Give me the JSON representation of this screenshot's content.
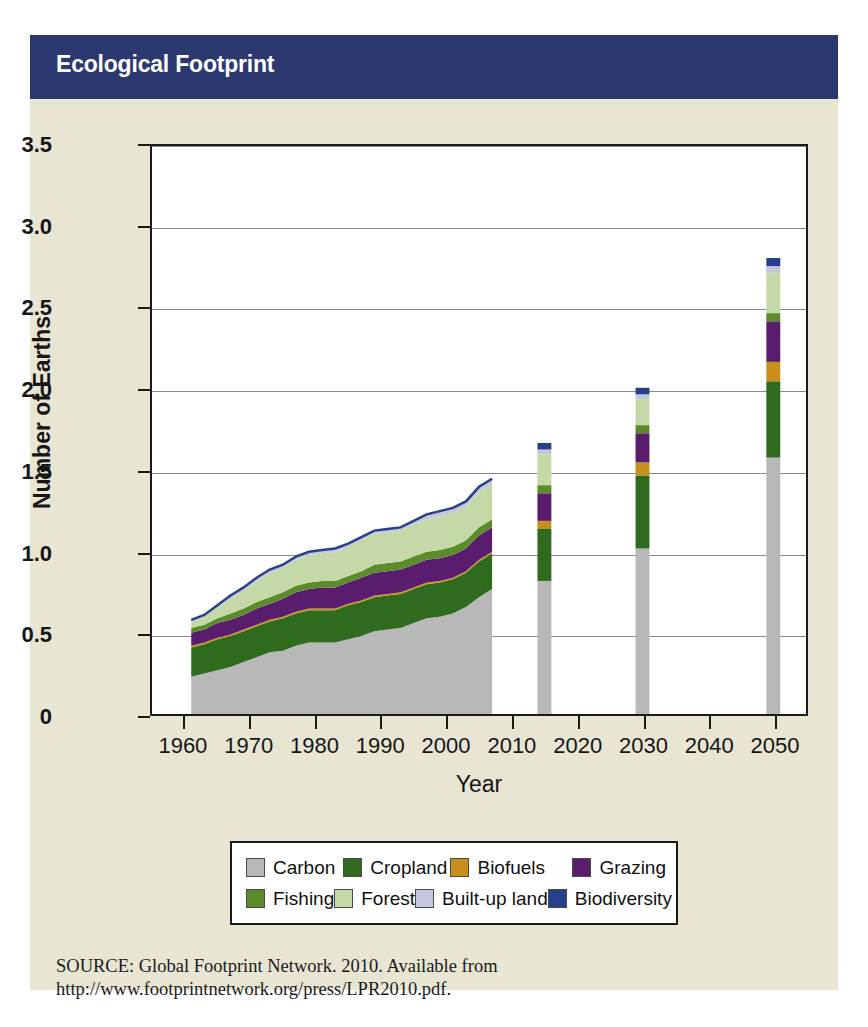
{
  "banner": {
    "title": "Ecological Footprint"
  },
  "source": {
    "line1": "SOURCE: Global Footprint Network. 2010. Available from",
    "line2": "http://www.footprintnetwork.org/press/LPR2010.pdf."
  },
  "colors": {
    "banner_bg": "#2b3970",
    "figure_bg": "#e8e5d2",
    "plot_bg": "#ffffff",
    "axis": "#1a1a1a",
    "grid": "#8a8a8a",
    "carbon": "#b8b8b8",
    "cropland": "#2e6b1f",
    "biofuels": "#c8901a",
    "grazing": "#5a1d6e",
    "fishing": "#5c8c2a",
    "forest": "#c5d9a8",
    "builtup": "#c3c6dd",
    "biodiversity": "#27408b"
  },
  "legend": {
    "rows": [
      [
        {
          "label": "Carbon",
          "key": "carbon"
        },
        {
          "label": "Cropland",
          "key": "cropland"
        },
        {
          "label": "Biofuels",
          "key": "biofuels"
        },
        {
          "label": "Grazing",
          "key": "grazing"
        }
      ],
      [
        {
          "label": "Fishing",
          "key": "fishing"
        },
        {
          "label": "Forest",
          "key": "forest"
        },
        {
          "label": "Built-up land",
          "key": "builtup"
        },
        {
          "label": "Biodiversity",
          "key": "biodiversity"
        }
      ]
    ]
  },
  "chart_data": {
    "type": "area",
    "title": "Ecological Footprint",
    "xlabel": "Year",
    "ylabel": "Number of Earths",
    "xlim": [
      1955,
      2055
    ],
    "ylim": [
      0,
      3.5
    ],
    "ytick_labels": [
      "0",
      "0.5",
      "1.0",
      "1.5",
      "2.0",
      "2.5",
      "3.0",
      "3.5"
    ],
    "ytick_values": [
      0,
      0.5,
      1.0,
      1.5,
      2.0,
      2.5,
      3.0,
      3.5
    ],
    "xtick_labels": [
      "1960",
      "1970",
      "1980",
      "1990",
      "2000",
      "2010",
      "2020",
      "2030",
      "2040",
      "2050"
    ],
    "xtick_values": [
      1960,
      1970,
      1980,
      1990,
      2000,
      2010,
      2020,
      2030,
      2040,
      2050
    ],
    "grid": "horizontal",
    "legend_position": "below-axis",
    "series_order": [
      "carbon",
      "cropland",
      "biofuels",
      "grazing",
      "fishing",
      "forest",
      "builtup",
      "biodiversity"
    ],
    "series_labels": {
      "carbon": "Carbon",
      "cropland": "Cropland",
      "biofuels": "Biofuels",
      "grazing": "Grazing",
      "fishing": "Fishing",
      "forest": "Forest",
      "builtup": "Built-up land",
      "biodiversity": "Biodiversity"
    },
    "historical": {
      "note": "Stacked area, 1961-2007",
      "x": [
        1961,
        1963,
        1965,
        1967,
        1969,
        1971,
        1973,
        1975,
        1977,
        1979,
        1981,
        1983,
        1985,
        1987,
        1989,
        1991,
        1993,
        1995,
        1997,
        1999,
        2001,
        2003,
        2005,
        2007
      ],
      "series": [
        {
          "name": "Carbon",
          "values": [
            0.23,
            0.25,
            0.27,
            0.29,
            0.32,
            0.35,
            0.38,
            0.39,
            0.42,
            0.44,
            0.44,
            0.44,
            0.46,
            0.48,
            0.51,
            0.52,
            0.53,
            0.56,
            0.59,
            0.6,
            0.62,
            0.66,
            0.72,
            0.77
          ]
        },
        {
          "name": "Cropland",
          "values": [
            0.18,
            0.18,
            0.19,
            0.19,
            0.19,
            0.19,
            0.19,
            0.2,
            0.2,
            0.2,
            0.2,
            0.2,
            0.21,
            0.21,
            0.21,
            0.21,
            0.21,
            0.21,
            0.21,
            0.21,
            0.21,
            0.21,
            0.22,
            0.22
          ]
        },
        {
          "name": "Biofuels",
          "values": [
            0.01,
            0.01,
            0.01,
            0.01,
            0.01,
            0.01,
            0.01,
            0.01,
            0.01,
            0.01,
            0.01,
            0.01,
            0.01,
            0.01,
            0.01,
            0.01,
            0.01,
            0.01,
            0.01,
            0.01,
            0.01,
            0.01,
            0.01,
            0.01
          ]
        },
        {
          "name": "Grazing",
          "values": [
            0.08,
            0.08,
            0.09,
            0.09,
            0.09,
            0.1,
            0.1,
            0.11,
            0.12,
            0.12,
            0.13,
            0.13,
            0.13,
            0.14,
            0.14,
            0.14,
            0.14,
            0.14,
            0.14,
            0.14,
            0.14,
            0.14,
            0.15,
            0.15
          ]
        },
        {
          "name": "Fishing",
          "values": [
            0.03,
            0.03,
            0.03,
            0.04,
            0.04,
            0.04,
            0.04,
            0.04,
            0.04,
            0.04,
            0.04,
            0.04,
            0.04,
            0.04,
            0.05,
            0.05,
            0.05,
            0.05,
            0.05,
            0.05,
            0.05,
            0.05,
            0.05,
            0.05
          ]
        },
        {
          "name": "Forest",
          "values": [
            0.04,
            0.05,
            0.07,
            0.09,
            0.11,
            0.13,
            0.15,
            0.15,
            0.16,
            0.17,
            0.17,
            0.18,
            0.18,
            0.19,
            0.19,
            0.19,
            0.19,
            0.2,
            0.2,
            0.21,
            0.21,
            0.21,
            0.22,
            0.22
          ]
        },
        {
          "name": "Built-up land",
          "values": [
            0.01,
            0.01,
            0.01,
            0.02,
            0.02,
            0.02,
            0.02,
            0.02,
            0.02,
            0.02,
            0.02,
            0.02,
            0.02,
            0.02,
            0.02,
            0.02,
            0.02,
            0.02,
            0.03,
            0.03,
            0.03,
            0.03,
            0.03,
            0.03
          ]
        }
      ],
      "totals": [
        0.58,
        0.61,
        0.67,
        0.73,
        0.78,
        0.84,
        0.89,
        0.92,
        0.97,
        1.0,
        1.01,
        1.02,
        1.05,
        1.09,
        1.13,
        1.14,
        1.15,
        1.19,
        1.23,
        1.25,
        1.27,
        1.31,
        1.4,
        1.45
      ]
    },
    "projections": [
      {
        "year": 2015,
        "total": 1.67,
        "segments": [
          {
            "name": "Carbon",
            "value": 0.82
          },
          {
            "name": "Cropland",
            "value": 0.32
          },
          {
            "name": "Biofuels",
            "value": 0.05
          },
          {
            "name": "Grazing",
            "value": 0.17
          },
          {
            "name": "Fishing",
            "value": 0.05
          },
          {
            "name": "Forest",
            "value": 0.19
          },
          {
            "name": "Built-up land",
            "value": 0.03
          },
          {
            "name": "Biodiversity",
            "value": 0.04
          }
        ]
      },
      {
        "year": 2030,
        "total": 2.01,
        "segments": [
          {
            "name": "Carbon",
            "value": 1.02
          },
          {
            "name": "Cropland",
            "value": 0.45
          },
          {
            "name": "Biofuels",
            "value": 0.08
          },
          {
            "name": "Grazing",
            "value": 0.18
          },
          {
            "name": "Fishing",
            "value": 0.05
          },
          {
            "name": "Forest",
            "value": 0.16
          },
          {
            "name": "Built-up land",
            "value": 0.03
          },
          {
            "name": "Biodiversity",
            "value": 0.04
          }
        ]
      },
      {
        "year": 2050,
        "total": 2.81,
        "segments": [
          {
            "name": "Carbon",
            "value": 1.58
          },
          {
            "name": "Cropland",
            "value": 0.47
          },
          {
            "name": "Biofuels",
            "value": 0.12
          },
          {
            "name": "Grazing",
            "value": 0.25
          },
          {
            "name": "Fishing",
            "value": 0.05
          },
          {
            "name": "Forest",
            "value": 0.25
          },
          {
            "name": "Built-up land",
            "value": 0.04
          },
          {
            "name": "Biodiversity",
            "value": 0.05
          }
        ]
      }
    ]
  }
}
